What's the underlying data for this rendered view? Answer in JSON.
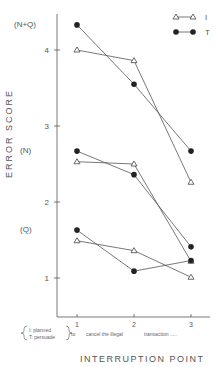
{
  "chart_data": {
    "type": "line",
    "title": "",
    "xlabel": "INTERRUPTION POINT",
    "ylabel": "ERROR SCORE",
    "x": [
      1,
      2,
      3
    ],
    "x_tick_labels": [
      "1",
      "2",
      "3"
    ],
    "y_ticks": [
      1,
      2,
      3,
      4
    ],
    "y_annotations": [
      {
        "label": "(N+Q)",
        "y": 4.33
      },
      {
        "label": "(N)",
        "y": 2.67
      },
      {
        "label": "(Q)",
        "y": 1.63
      }
    ],
    "ylim": [
      0.5,
      4.5
    ],
    "grid": false,
    "legend": {
      "position": "top-right",
      "entries": [
        {
          "name": "I",
          "marker": "open-triangle"
        },
        {
          "name": "T",
          "marker": "filled-circle"
        }
      ]
    },
    "series": [
      {
        "name": "I",
        "group": "(N+Q)",
        "values": [
          4.0,
          3.86,
          2.26
        ]
      },
      {
        "name": "T",
        "group": "(N+Q)",
        "values": [
          4.33,
          3.55,
          2.67
        ]
      },
      {
        "name": "I",
        "group": "(N)",
        "values": [
          2.53,
          2.5,
          1.22
        ]
      },
      {
        "name": "T",
        "group": "(N)",
        "values": [
          2.67,
          2.36,
          1.41
        ]
      },
      {
        "name": "I",
        "group": "(Q)",
        "values": [
          1.49,
          1.36,
          1.01
        ]
      },
      {
        "name": "T",
        "group": "(Q)",
        "values": [
          1.63,
          1.09,
          1.23
        ]
      }
    ],
    "x_annotation": {
      "brace_top": "I: planned",
      "brace_bottom": "T: persuade",
      "segments": [
        "to",
        "cancel the illegal",
        "transaction ....."
      ]
    }
  }
}
